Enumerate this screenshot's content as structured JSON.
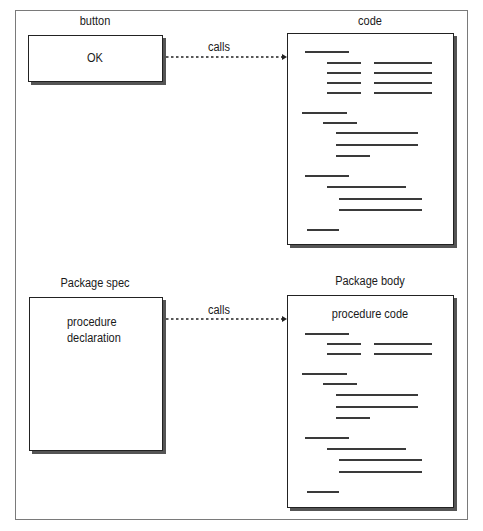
{
  "diagram": {
    "top": {
      "left_title": "button",
      "left_box_text": "OK",
      "edge_label": "calls",
      "right_title": "code"
    },
    "bottom": {
      "left_title": "Package spec",
      "left_box_text_line1": "procedure",
      "left_box_text_line2": "declaration",
      "edge_label": "calls",
      "right_title": "Package body",
      "right_box_heading": "procedure code"
    },
    "colors": {
      "frame": "#7a7a7a",
      "box_border": "#222222",
      "shadow": "#555555",
      "code_line": "#3a3a3a"
    },
    "code_lines_top": [
      {
        "x": 305,
        "y": 51,
        "w": 44
      },
      {
        "x": 327,
        "y": 62,
        "w": 34
      },
      {
        "x": 374,
        "y": 62,
        "w": 58
      },
      {
        "x": 327,
        "y": 72,
        "w": 34
      },
      {
        "x": 374,
        "y": 72,
        "w": 58
      },
      {
        "x": 327,
        "y": 82,
        "w": 34
      },
      {
        "x": 374,
        "y": 82,
        "w": 58
      },
      {
        "x": 327,
        "y": 92,
        "w": 34
      },
      {
        "x": 374,
        "y": 92,
        "w": 58
      },
      {
        "x": 302,
        "y": 112,
        "w": 45
      },
      {
        "x": 323,
        "y": 122,
        "w": 34
      },
      {
        "x": 336,
        "y": 132,
        "w": 82
      },
      {
        "x": 336,
        "y": 144,
        "w": 82
      },
      {
        "x": 336,
        "y": 155,
        "w": 34
      },
      {
        "x": 305,
        "y": 175,
        "w": 44
      },
      {
        "x": 327,
        "y": 186,
        "w": 79
      },
      {
        "x": 339,
        "y": 198,
        "w": 83
      },
      {
        "x": 339,
        "y": 209,
        "w": 83
      },
      {
        "x": 307,
        "y": 229,
        "w": 32
      }
    ],
    "code_lines_bottom": [
      {
        "x": 305,
        "y": 333,
        "w": 44
      },
      {
        "x": 327,
        "y": 343,
        "w": 34
      },
      {
        "x": 374,
        "y": 343,
        "w": 58
      },
      {
        "x": 327,
        "y": 353,
        "w": 34
      },
      {
        "x": 374,
        "y": 353,
        "w": 58
      },
      {
        "x": 302,
        "y": 373,
        "w": 45
      },
      {
        "x": 323,
        "y": 383,
        "w": 34
      },
      {
        "x": 336,
        "y": 394,
        "w": 82
      },
      {
        "x": 336,
        "y": 406,
        "w": 82
      },
      {
        "x": 336,
        "y": 417,
        "w": 34
      },
      {
        "x": 305,
        "y": 437,
        "w": 44
      },
      {
        "x": 327,
        "y": 448,
        "w": 79
      },
      {
        "x": 339,
        "y": 459,
        "w": 83
      },
      {
        "x": 339,
        "y": 471,
        "w": 83
      },
      {
        "x": 307,
        "y": 491,
        "w": 32
      }
    ]
  }
}
